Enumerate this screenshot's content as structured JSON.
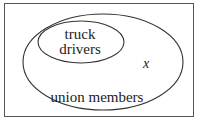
{
  "diagram": {
    "type": "venn",
    "universe": {
      "label": ""
    },
    "sets": [
      {
        "id": "union-members",
        "label": "union members",
        "contains": [
          "truck-drivers"
        ]
      },
      {
        "id": "truck-drivers",
        "label_line1": "truck",
        "label_line2": "drivers"
      }
    ],
    "point": {
      "label": "x",
      "location": "inside union members, outside truck drivers"
    },
    "colors": {
      "stroke": "#333333",
      "background": "#ffffff"
    }
  }
}
